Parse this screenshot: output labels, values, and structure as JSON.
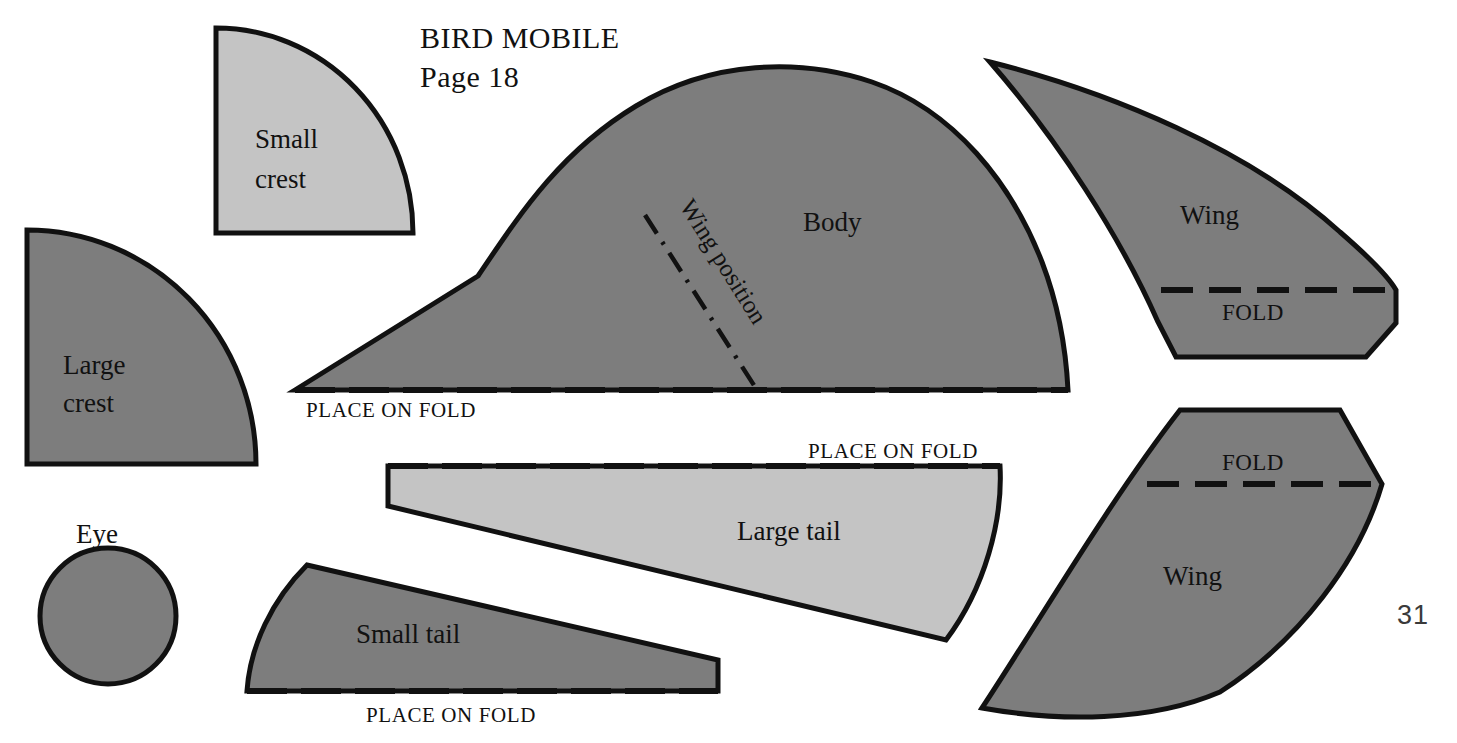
{
  "document": {
    "title_line1": "BIRD MOBILE",
    "title_line2": "Page 18",
    "page_number": "31",
    "colors": {
      "dark_gray": "#7d7d7d",
      "light_gray": "#c4c4c4",
      "outline": "#111111",
      "background": "#ffffff"
    }
  },
  "pieces": {
    "small_crest": {
      "label_line1": "Small",
      "label_line2": "crest",
      "fill": "light_gray",
      "shape": "quarter-circle"
    },
    "large_crest": {
      "label_line1": "Large",
      "label_line2": "crest",
      "fill": "dark_gray",
      "shape": "quarter-circle"
    },
    "eye": {
      "label": "Eye",
      "fill": "dark_gray",
      "shape": "circle"
    },
    "body": {
      "label": "Body",
      "fill": "dark_gray",
      "shape": "dome",
      "fold_label": "PLACE ON FOLD",
      "wing_position_label": "Wing position"
    },
    "wing_top": {
      "label": "Wing",
      "fill": "dark_gray",
      "fold_label": "FOLD"
    },
    "wing_bottom": {
      "label": "Wing",
      "fill": "dark_gray",
      "fold_label": "FOLD"
    },
    "large_tail": {
      "label": "Large tail",
      "fill": "light_gray",
      "fold_label": "PLACE ON FOLD"
    },
    "small_tail": {
      "label": "Small tail",
      "fill": "dark_gray",
      "fold_label": "PLACE ON FOLD"
    }
  }
}
